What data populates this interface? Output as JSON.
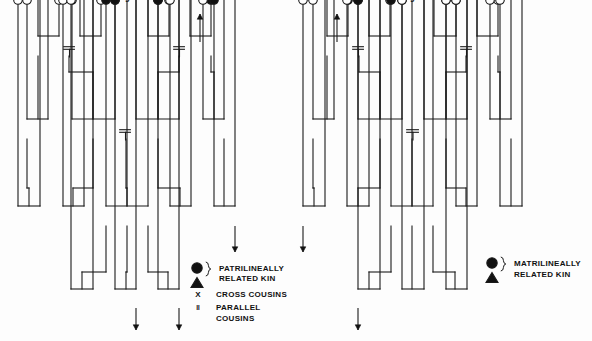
{
  "figure": {
    "background": "#fdfdfd",
    "line_color": "#1a1a1a",
    "fill_color": "#111111",
    "open_color": "#ffffff"
  },
  "diagrams": [
    {
      "id": "left",
      "name": "patrilineal-descent-chart",
      "legend": {
        "related_kin_label_line1": "PATRILINEALLY",
        "related_kin_label_line2": "RELATED KIN",
        "cross_symbol": "X",
        "cross_label": "CROSS COUSINS",
        "parallel_symbol": "‖",
        "parallel_label_line1": "PARALLEL",
        "parallel_label_line2": "COUSINS",
        "circle_sym_name": "filled-circle-female",
        "triangle_sym_name": "filled-triangle-male"
      },
      "generations": [
        {
          "name": "grandparent-generation",
          "y": 48,
          "nodes": [
            {
              "x": 38,
              "shape": "triangle",
              "filled": false,
              "label": ""
            },
            {
              "x": 59,
              "shape": "circle",
              "filled": false,
              "label": ""
            },
            {
              "x": 80,
              "shape": "triangle",
              "filled": false,
              "label": ""
            },
            {
              "x": 101,
              "shape": "circle",
              "filled": false,
              "label": ""
            },
            {
              "x": 148,
              "shape": "triangle",
              "filled": false,
              "label": ""
            },
            {
              "x": 169,
              "shape": "circle",
              "filled": false,
              "label": ""
            },
            {
              "x": 190,
              "shape": "triangle",
              "filled": true,
              "label": ""
            },
            {
              "x": 211,
              "shape": "circle",
              "filled": true,
              "label": ""
            }
          ]
        },
        {
          "name": "parent-generation",
          "y": 131,
          "nodes": [
            {
              "x": 27,
              "shape": "circle",
              "filled": false,
              "label": ""
            },
            {
              "x": 48,
              "shape": "triangle",
              "filled": false,
              "label": ""
            },
            {
              "x": 72,
              "shape": "circle",
              "filled": false,
              "label": ""
            },
            {
              "x": 93,
              "shape": "triangle",
              "filled": false,
              "label": ""
            },
            {
              "x": 115,
              "shape": "circle",
              "filled": false,
              "label": ""
            },
            {
              "x": 136,
              "shape": "triangle",
              "filled": true,
              "label": ""
            },
            {
              "x": 158,
              "shape": "circle",
              "filled": true,
              "label": ""
            },
            {
              "x": 179,
              "shape": "triangle",
              "filled": true,
              "label": ""
            },
            {
              "x": 203,
              "shape": "circle",
              "filled": false,
              "label": ""
            },
            {
              "x": 224,
              "shape": "triangle",
              "filled": false,
              "label": ""
            }
          ]
        },
        {
          "name": "ego-generation",
          "y": 218,
          "nodes": [
            {
              "x": 18,
              "shape": "circle",
              "filled": false,
              "label": "‖"
            },
            {
              "x": 40,
              "shape": "triangle",
              "filled": false,
              "label": "‖"
            },
            {
              "x": 63,
              "shape": "circle",
              "filled": false,
              "label": "X"
            },
            {
              "x": 84,
              "shape": "triangle",
              "filled": false,
              "label": "X"
            },
            {
              "x": 106,
              "shape": "circle",
              "filled": true,
              "label": ""
            },
            {
              "x": 127,
              "shape": "triangle",
              "filled": true,
              "label": "Ego"
            },
            {
              "x": 148,
              "shape": "triangle",
              "filled": true,
              "label": ""
            },
            {
              "x": 170,
              "shape": "circle",
              "filled": false,
              "label": "X"
            },
            {
              "x": 191,
              "shape": "triangle",
              "filled": false,
              "label": "X"
            },
            {
              "x": 214,
              "shape": "circle",
              "filled": true,
              "label": "‖"
            },
            {
              "x": 235,
              "shape": "triangle",
              "filled": true,
              "label": "‖"
            }
          ]
        },
        {
          "name": "child-generation",
          "y": 301,
          "nodes": [
            {
              "x": 71,
              "shape": "circle",
              "filled": false,
              "label": ""
            },
            {
              "x": 93,
              "shape": "triangle",
              "filled": false,
              "label": ""
            },
            {
              "x": 115,
              "shape": "circle",
              "filled": true,
              "label": ""
            },
            {
              "x": 136,
              "shape": "triangle",
              "filled": true,
              "label": ""
            },
            {
              "x": 158,
              "shape": "circle",
              "filled": true,
              "label": ""
            },
            {
              "x": 179,
              "shape": "triangle",
              "filled": true,
              "label": ""
            }
          ]
        }
      ],
      "marriages": [
        {
          "x1": 59,
          "x2": 80,
          "y": 48
        },
        {
          "x1": 169,
          "x2": 190,
          "y": 48
        },
        {
          "x1": 115,
          "x2": 136,
          "y": 131
        }
      ],
      "arrows": [
        {
          "x": 200,
          "y_from": 42,
          "y_to": 14,
          "dir": "up",
          "name": "patriline-continues-up"
        },
        {
          "x": 235,
          "y_from": 226,
          "y_to": 252,
          "dir": "down",
          "name": "patriline-continues-down-right"
        },
        {
          "x": 136,
          "y_from": 308,
          "y_to": 330,
          "dir": "down",
          "name": "patriline-continues-down-1"
        },
        {
          "x": 179,
          "y_from": 308,
          "y_to": 330,
          "dir": "down",
          "name": "patriline-continues-down-2"
        }
      ]
    },
    {
      "id": "right",
      "name": "matrilineal-descent-chart",
      "legend": {
        "related_kin_label_line1": "MATRILINEALLY",
        "related_kin_label_line2": "RELATED KIN",
        "circle_sym_name": "filled-circle-female",
        "triangle_sym_name": "filled-triangle-male"
      },
      "generations": [
        {
          "name": "grandparent-generation",
          "y": 48,
          "nodes": [
            {
              "x": 327,
              "shape": "triangle",
              "filled": true,
              "label": ""
            },
            {
              "x": 348,
              "shape": "circle",
              "filled": true,
              "label": ""
            },
            {
              "x": 369,
              "shape": "triangle",
              "filled": false,
              "label": ""
            },
            {
              "x": 390,
              "shape": "circle",
              "filled": false,
              "label": ""
            },
            {
              "x": 434,
              "shape": "triangle",
              "filled": false,
              "label": ""
            },
            {
              "x": 456,
              "shape": "circle",
              "filled": false,
              "label": ""
            },
            {
              "x": 477,
              "shape": "triangle",
              "filled": false,
              "label": ""
            },
            {
              "x": 498,
              "shape": "circle",
              "filled": false,
              "label": ""
            }
          ]
        },
        {
          "name": "parent-generation",
          "y": 131,
          "nodes": [
            {
              "x": 313,
              "shape": "circle",
              "filled": false,
              "label": ""
            },
            {
              "x": 334,
              "shape": "triangle",
              "filled": false,
              "label": ""
            },
            {
              "x": 358,
              "shape": "circle",
              "filled": true,
              "label": ""
            },
            {
              "x": 380,
              "shape": "triangle",
              "filled": true,
              "label": ""
            },
            {
              "x": 402,
              "shape": "circle",
              "filled": true,
              "label": ""
            },
            {
              "x": 424,
              "shape": "triangle",
              "filled": false,
              "label": ""
            },
            {
              "x": 446,
              "shape": "circle",
              "filled": false,
              "label": ""
            },
            {
              "x": 467,
              "shape": "triangle",
              "filled": false,
              "label": ""
            },
            {
              "x": 490,
              "shape": "circle",
              "filled": false,
              "label": ""
            },
            {
              "x": 511,
              "shape": "triangle",
              "filled": false,
              "label": ""
            }
          ]
        },
        {
          "name": "ego-generation",
          "y": 218,
          "nodes": [
            {
              "x": 303,
              "shape": "circle",
              "filled": false,
              "label": "‖"
            },
            {
              "x": 325,
              "shape": "triangle",
              "filled": false,
              "label": "‖"
            },
            {
              "x": 347,
              "shape": "circle",
              "filled": false,
              "label": "X"
            },
            {
              "x": 369,
              "shape": "triangle",
              "filled": false,
              "label": "X"
            },
            {
              "x": 391,
              "shape": "circle",
              "filled": true,
              "label": ""
            },
            {
              "x": 412,
              "shape": "triangle",
              "filled": true,
              "label": "Ego"
            },
            {
              "x": 433,
              "shape": "triangle",
              "filled": true,
              "label": ""
            },
            {
              "x": 456,
              "shape": "circle",
              "filled": false,
              "label": "X"
            },
            {
              "x": 477,
              "shape": "triangle",
              "filled": false,
              "label": "X"
            },
            {
              "x": 500,
              "shape": "circle",
              "filled": false,
              "label": "‖"
            },
            {
              "x": 522,
              "shape": "triangle",
              "filled": false,
              "label": "‖"
            }
          ]
        },
        {
          "name": "child-generation",
          "y": 301,
          "nodes": [
            {
              "x": 358,
              "shape": "circle",
              "filled": true,
              "label": ""
            },
            {
              "x": 380,
              "shape": "triangle",
              "filled": true,
              "label": ""
            },
            {
              "x": 402,
              "shape": "circle",
              "filled": false,
              "label": ""
            },
            {
              "x": 424,
              "shape": "triangle",
              "filled": false,
              "label": ""
            },
            {
              "x": 446,
              "shape": "circle",
              "filled": false,
              "label": ""
            },
            {
              "x": 467,
              "shape": "triangle",
              "filled": false,
              "label": ""
            }
          ]
        }
      ],
      "marriages": [
        {
          "x1": 348,
          "x2": 369,
          "y": 48
        },
        {
          "x1": 456,
          "x2": 477,
          "y": 48
        },
        {
          "x1": 402,
          "x2": 424,
          "y": 131
        }
      ],
      "arrows": [
        {
          "x": 337,
          "y_from": 42,
          "y_to": 14,
          "dir": "up",
          "name": "matriline-continues-up"
        },
        {
          "x": 303,
          "y_from": 226,
          "y_to": 252,
          "dir": "down",
          "name": "matriline-continues-down-left"
        },
        {
          "x": 358,
          "y_from": 308,
          "y_to": 330,
          "dir": "down",
          "name": "matriline-continues-down-1"
        }
      ]
    }
  ]
}
